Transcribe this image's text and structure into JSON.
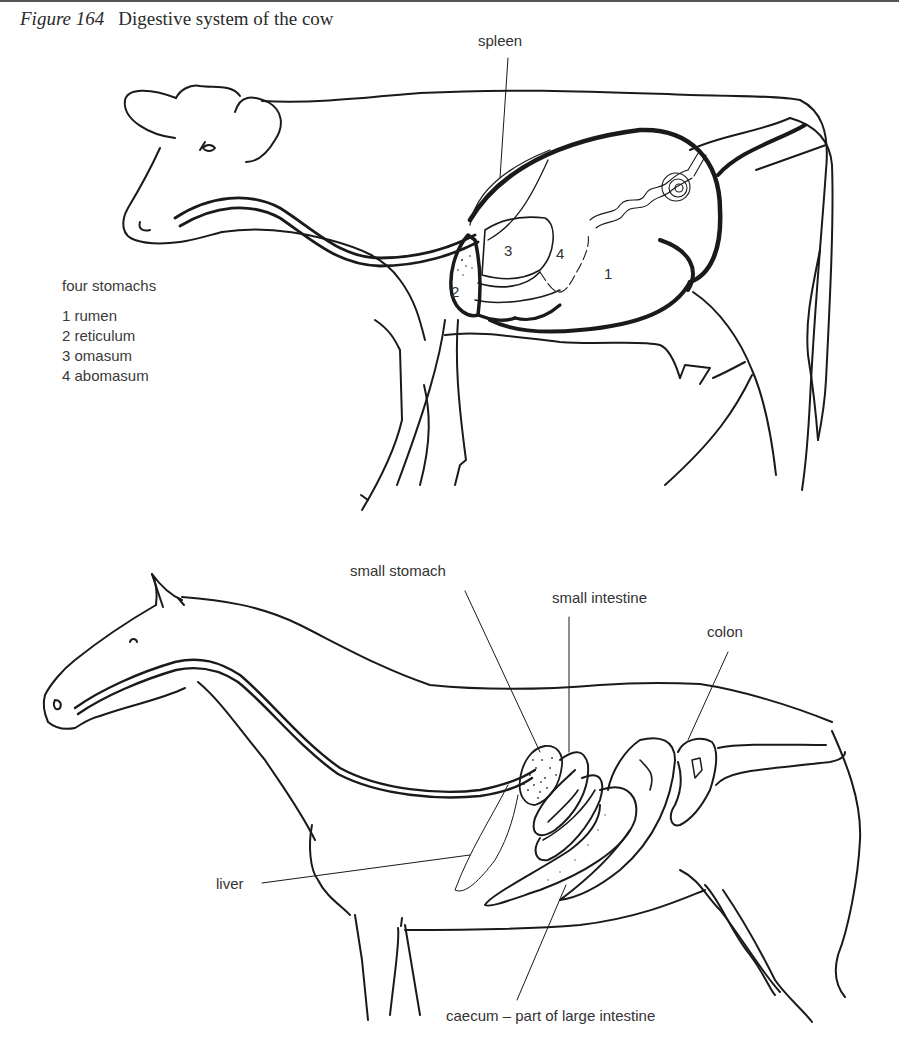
{
  "figure": {
    "number": "Figure 164",
    "title": "Digestive system of the cow"
  },
  "cow": {
    "labels": {
      "spleen": "spleen"
    },
    "stomach_numbers": [
      "1",
      "2",
      "3",
      "4"
    ],
    "key": {
      "title": "four stomachs",
      "items": [
        {
          "num": "1",
          "name": "rumen",
          "text": "1 rumen"
        },
        {
          "num": "2",
          "name": "reticulum",
          "text": "2 reticulum"
        },
        {
          "num": "3",
          "name": "omasum",
          "text": "3 omasum"
        },
        {
          "num": "4",
          "name": "abomasum",
          "text": "4 abomasum"
        }
      ]
    }
  },
  "horse": {
    "labels": {
      "small_stomach": "small stomach",
      "small_intestine": "small intestine",
      "colon": "colon",
      "liver": "liver",
      "caecum": "caecum – part of large intestine"
    }
  },
  "colors": {
    "ink": "#1a1a1a",
    "label_text": "#333333",
    "background": "#ffffff"
  }
}
